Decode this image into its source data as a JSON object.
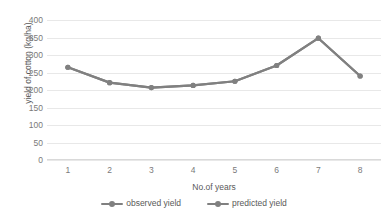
{
  "chart_data": {
    "type": "line",
    "title": "",
    "xlabel": "No.of years",
    "ylabel": "yield of cotton (kg/ha)",
    "categories": [
      "1",
      "2",
      "3",
      "4",
      "5",
      "6",
      "7",
      "8"
    ],
    "ylim": [
      0,
      400
    ],
    "ytick_labels": [
      "400",
      "350",
      "300",
      "250",
      "200",
      "150",
      "100",
      "50",
      "0"
    ],
    "ytick_values": [
      400,
      350,
      300,
      250,
      200,
      150,
      100,
      50,
      0
    ],
    "grid": true,
    "legend_position": "bottom",
    "series": [
      {
        "name": "observed yield",
        "color": "#808080",
        "values": [
          265,
          221,
          207,
          213,
          225,
          270,
          348,
          240
        ]
      },
      {
        "name": "predicted yield",
        "color": "#808080",
        "values": [
          265,
          221,
          207,
          213,
          225,
          270,
          348,
          240
        ]
      }
    ]
  },
  "legend": {
    "items": [
      {
        "label": "observed yield",
        "color": "#808080"
      },
      {
        "label": "predicted yield",
        "color": "#808080"
      }
    ]
  }
}
